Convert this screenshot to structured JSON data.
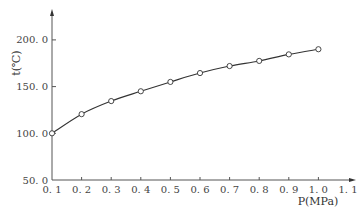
{
  "chart_data": {
    "type": "line",
    "title": "",
    "xlabel": "P(MPa)",
    "ylabel": "t(℃)",
    "xlim": [
      0.1,
      1.1
    ],
    "ylim": [
      50.0,
      225.0
    ],
    "x_ticks": [
      "0.1",
      "0.2",
      "0.3",
      "0.4",
      "0.5",
      "0.6",
      "0.7",
      "0.8",
      "0.9",
      "1.0",
      "1.1"
    ],
    "y_ticks": [
      "50.0",
      "100.0",
      "150.0",
      "200.0"
    ],
    "grid": false,
    "legend": "none",
    "series": [
      {
        "name": "t",
        "marker": "open-circle",
        "x": [
          0.1,
          0.2,
          0.3,
          0.4,
          0.5,
          0.6,
          0.7,
          0.8,
          0.9,
          1.0
        ],
        "y": [
          100.0,
          120.5,
          134.5,
          145.0,
          155.0,
          164.5,
          172.0,
          177.5,
          184.5,
          190.0
        ]
      }
    ]
  }
}
